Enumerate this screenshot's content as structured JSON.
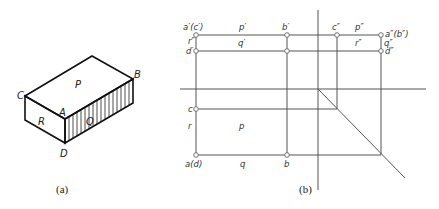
{
  "figure_a": {
    "caption": "(a)",
    "vertex_labels": {
      "A": "A",
      "B": "B",
      "C": "C",
      "D": "D"
    },
    "face_labels": {
      "top": "P",
      "front_left": "R",
      "front_right": "Q"
    },
    "hatched_face": "Q"
  },
  "figure_b": {
    "caption": "(b)",
    "front_view": {
      "point_labels": {
        "top_left": "a′(c′)",
        "top_right": "b′",
        "mid_left_r": "r″",
        "bottom_left": "d′"
      },
      "face_labels": {
        "top": "p′",
        "bottom": "q′"
      }
    },
    "side_view": {
      "point_labels": {
        "top_left": "c″",
        "top_right": "a″(b″)",
        "q_label": "q″",
        "bottom_right": "d″"
      },
      "face_labels": {
        "top": "p″",
        "bottom": "r″"
      }
    },
    "top_view": {
      "point_labels": {
        "top_left": "c",
        "bottom_left": "a(d)",
        "bottom_right": "b"
      },
      "face_labels": {
        "left": "r",
        "center": "p",
        "bottom": "q"
      }
    }
  }
}
